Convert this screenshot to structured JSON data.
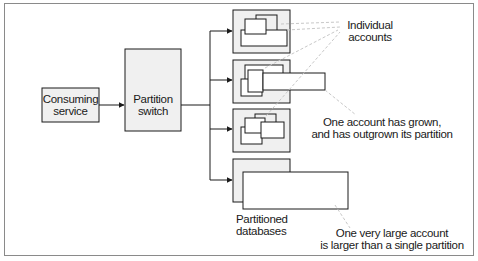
{
  "diagram": {
    "nodes": {
      "consuming_service": {
        "line1": "Consuming",
        "line2": "service"
      },
      "partition_switch": {
        "line1": "Partition",
        "line2": "switch"
      }
    },
    "partitions": [
      {
        "id": "partition-1",
        "description": "Individual accounts fit within partition"
      },
      {
        "id": "partition-2",
        "description": "One account overflows partition"
      },
      {
        "id": "partition-3",
        "description": "Individual accounts fit within partition"
      },
      {
        "id": "partition-4",
        "description": "One very large account larger than partition"
      }
    ],
    "annotations": {
      "individual_accounts": {
        "line1": "Individual",
        "line2": "accounts"
      },
      "outgrown": {
        "line1": "One account has grown,",
        "line2": "and has outgrown its partition"
      },
      "partitioned_databases": {
        "line1": "Partitioned",
        "line2": "databases"
      },
      "very_large": {
        "line1": "One very large account",
        "line2": "is larger than a single partition"
      }
    },
    "colors": {
      "box_fill": "#f0f0f0",
      "stroke": "#1a1a1a",
      "leader": "#c8c8c8",
      "frame": "#8a8a8a"
    }
  }
}
